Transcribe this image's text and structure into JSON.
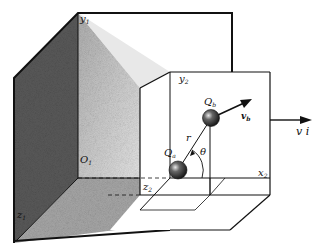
{
  "figure": {
    "frame1": {
      "y_axis": {
        "main": "y",
        "sub": "1"
      },
      "origin": {
        "main": "O",
        "sub": "1"
      },
      "z_axis": {
        "main": "z",
        "sub": "1"
      }
    },
    "frame2": {
      "y_axis": {
        "main": "y",
        "sub": "2"
      },
      "x_axis": {
        "main": "x",
        "sub": "2"
      },
      "z_axis": {
        "main": "z",
        "sub": "2"
      }
    },
    "charge_a": {
      "main": "Q",
      "sub": "a"
    },
    "charge_b": {
      "main": "Q",
      "sub": "b"
    },
    "separation": "r",
    "angle": "θ",
    "velocity_b": {
      "main": "v",
      "sub": "b"
    },
    "frame_velocity": "v i"
  }
}
